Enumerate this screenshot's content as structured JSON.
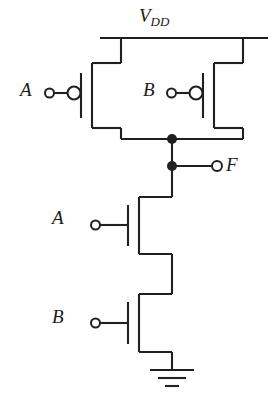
{
  "diagram": {
    "type": "cmos-logic-gate-schematic",
    "stroke_color": "#231f20",
    "background_color": "#ffffff",
    "labels": {
      "supply": "V",
      "supply_subscript": "DD",
      "pmos_a_input": "A",
      "pmos_b_input": "B",
      "nmos_a_input": "A",
      "nmos_b_input": "B",
      "output": "F"
    },
    "nodes": [
      {
        "name": "vdd-rail",
        "label": "V_DD"
      },
      {
        "name": "output-node",
        "label": "F"
      },
      {
        "name": "ground",
        "label": "GND"
      }
    ],
    "junctions": [
      {
        "name": "pmos-drain-junction",
        "x": 172,
        "y": 139
      },
      {
        "name": "output-tap-junction",
        "x": 172,
        "y": 166
      }
    ],
    "transistors": [
      {
        "name": "pmos-a",
        "type": "PMOS",
        "gate": "A",
        "inverted_gate": true
      },
      {
        "name": "pmos-b",
        "type": "PMOS",
        "gate": "B",
        "inverted_gate": true
      },
      {
        "name": "nmos-a",
        "type": "NMOS",
        "gate": "A",
        "inverted_gate": false
      },
      {
        "name": "nmos-b",
        "type": "NMOS",
        "gate": "B",
        "inverted_gate": false
      }
    ]
  }
}
